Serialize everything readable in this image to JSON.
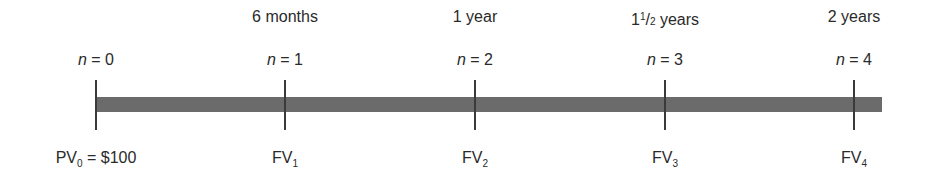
{
  "diagram": {
    "type": "timeline",
    "bar_color": "#6b6b6b",
    "tick_color": "#3a3a3a",
    "points": [
      {
        "x": 96,
        "period": "",
        "n_var": "n",
        "n_eq": " = 0",
        "bottom_main": "PV",
        "bottom_sub": "0",
        "bottom_rest": " = $100"
      },
      {
        "x": 285,
        "period": "6 months",
        "n_var": "n",
        "n_eq": " = 1",
        "bottom_main": "FV",
        "bottom_sub": "1",
        "bottom_rest": ""
      },
      {
        "x": 475,
        "period": "1 year",
        "n_var": "n",
        "n_eq": " = 2",
        "bottom_main": "FV",
        "bottom_sub": "2",
        "bottom_rest": ""
      },
      {
        "x": 665,
        "period_whole": "1",
        "period_num": "1",
        "period_den": "2",
        "period_unit": " years",
        "n_var": "n",
        "n_eq": " = 3",
        "bottom_main": "FV",
        "bottom_sub": "3",
        "bottom_rest": ""
      },
      {
        "x": 854,
        "period": "2 years",
        "n_var": "n",
        "n_eq": " = 4",
        "bottom_main": "FV",
        "bottom_sub": "4",
        "bottom_rest": ""
      }
    ]
  }
}
